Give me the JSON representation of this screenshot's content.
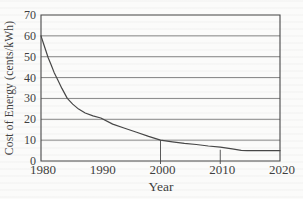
{
  "figure": {
    "kind": "scanned textbook line chart",
    "background_color": "#fbfbfa",
    "line_color": "#474747",
    "grid_color": "#6a6a6a",
    "text_color": "#3f3f3f"
  },
  "chart_data": {
    "type": "line",
    "title": "",
    "xlabel": "Year",
    "ylabel": "Cost of Energy (cents/kWh)",
    "xlim": [
      1980,
      2020
    ],
    "ylim": [
      0,
      70
    ],
    "x_ticks": [
      1980,
      1990,
      2000,
      2010,
      2020
    ],
    "y_ticks": [
      70,
      60,
      50,
      40,
      30,
      20,
      10,
      0
    ],
    "grid": "horizontal",
    "legend": "none",
    "series": [
      {
        "name": "cost-of-energy",
        "points": [
          [
            1980,
            60
          ],
          [
            1980.4,
            56.5
          ],
          [
            1980.8,
            53
          ],
          [
            1981.2,
            49.5
          ],
          [
            1981.7,
            46
          ],
          [
            1982.2,
            42.5
          ],
          [
            1982.8,
            39
          ],
          [
            1983.5,
            34.8
          ],
          [
            1984.4,
            30
          ],
          [
            1985.3,
            27.3
          ],
          [
            1986.3,
            24.9
          ],
          [
            1987.4,
            23
          ],
          [
            1988.7,
            21.6
          ],
          [
            1990,
            20.6
          ],
          [
            1992,
            17.7
          ],
          [
            1994,
            15.7
          ],
          [
            1996,
            13.8
          ],
          [
            1998,
            11.8
          ],
          [
            2000,
            10
          ],
          [
            2002,
            9.2
          ],
          [
            2004,
            8.5
          ],
          [
            2006,
            7.9
          ],
          [
            2008,
            7.2
          ],
          [
            2010,
            6.6
          ],
          [
            2012,
            5.8
          ],
          [
            2013.5,
            5.15
          ],
          [
            2014.5,
            5
          ],
          [
            2020,
            5
          ]
        ]
      }
    ],
    "droplines": [
      {
        "x": 2000,
        "y": 10
      },
      {
        "x": 2010,
        "y": 5.4
      }
    ]
  }
}
